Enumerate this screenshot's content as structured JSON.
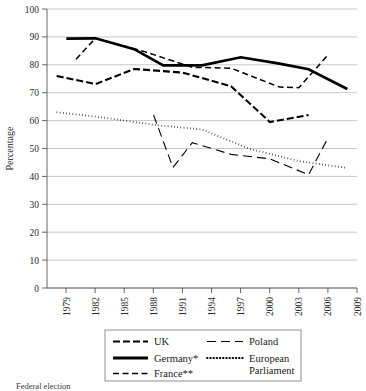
{
  "chart_data": {
    "type": "line",
    "title": "",
    "xlabel": "",
    "ylabel": "Percentage",
    "ylim": [
      0,
      100
    ],
    "ytick_step": 10,
    "yticks": [
      0,
      10,
      20,
      30,
      40,
      50,
      60,
      70,
      80,
      90,
      100
    ],
    "xticks": [
      "1979",
      "1982",
      "1985",
      "1988",
      "1991",
      "1994",
      "1997",
      "2000",
      "2003",
      "2006",
      "2009"
    ],
    "xlim": [
      1978,
      2010
    ],
    "grid": "horizontal",
    "legend_position": "below-plot",
    "series": [
      {
        "name": "UK",
        "style": "dash-dot",
        "x": [
          1979,
          1983,
          1987,
          1992,
          1997,
          2001,
          2005
        ],
        "values": [
          76.0,
          73.1,
          78.5,
          77.2,
          72.3,
          59.5,
          62.0
        ]
      },
      {
        "name": "Germany*",
        "style": "solid-thick",
        "x": [
          1980,
          1983,
          1987,
          1990,
          1994,
          1998,
          2002,
          2005,
          2009
        ],
        "values": [
          89.4,
          89.5,
          85.6,
          79.8,
          79.8,
          82.7,
          80.4,
          78.4,
          71.3
        ]
      },
      {
        "name": "France**",
        "style": "dashed",
        "x": [
          1981,
          1983,
          1988,
          1993,
          1997,
          2002,
          2004,
          2007
        ],
        "values": [
          82.0,
          89.5,
          84.8,
          79.1,
          78.8,
          72.0,
          71.8,
          83.5
        ]
      },
      {
        "name": "Poland",
        "style": "long-dash",
        "x": [
          1989,
          1991,
          1993,
          1997,
          2001,
          2005,
          2007
        ],
        "values": [
          62.0,
          43.2,
          52.1,
          47.9,
          46.3,
          40.6,
          53.8
        ]
      },
      {
        "name": "European Parliament",
        "style": "dotted",
        "x": [
          1979,
          1984,
          1989,
          1994,
          1999,
          2004,
          2009
        ],
        "values": [
          63.0,
          61.0,
          58.5,
          56.8,
          49.8,
          45.5,
          43.0
        ]
      }
    ]
  },
  "axis": {
    "y_title": "Percentage"
  },
  "legend": {
    "entries": [
      {
        "label": "UK",
        "style": "dash-dot"
      },
      {
        "label": "Poland",
        "style": "long-dash"
      },
      {
        "label": "Germany*",
        "style": "solid-thick"
      },
      {
        "label": "European",
        "style": "dotted"
      },
      {
        "label": "Parliament",
        "style": "none"
      },
      {
        "label": "France**",
        "style": "dashed"
      }
    ]
  },
  "footnote": {
    "text": "Federal election"
  }
}
